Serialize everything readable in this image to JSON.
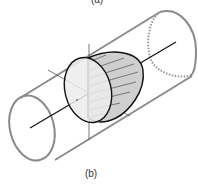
{
  "figure": {
    "top_label": "(a)",
    "bottom_label": "(b)",
    "colors": {
      "pipe": "#8a8a8a",
      "axis": "#111111",
      "profile_fill": "#cfcfcf",
      "disc_fill": "#ececec",
      "arrows": "#777777"
    }
  }
}
